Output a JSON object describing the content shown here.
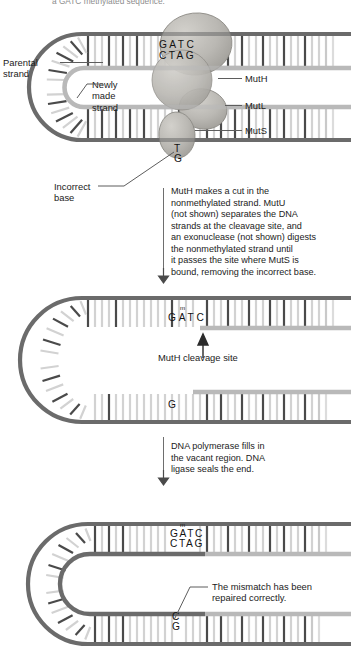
{
  "figure": {
    "title_fragment": "a GATC methylated sequence.",
    "kind": "DNA mismatch repair pathway (MutS / MutL / MutH)"
  },
  "panel1": {
    "labels": {
      "parental_strand": "Parental\nstrand",
      "newly_made_strand": "Newly\nmade\nstrand",
      "incorrect_base": "Incorrect\nbase",
      "muth": "MutH",
      "mutl": "MutL",
      "muts": "MutS"
    },
    "bases": {
      "top_strand": "GATC",
      "bottom_strand": "CTAG",
      "mismatch_top": "T",
      "mismatch_bottom": "G"
    }
  },
  "caption1": {
    "text": "MutH makes a cut in the\nnonmethylated strand. MutU\n(not shown) separates the DNA\nstrands at the cleavage site, and\nan exonuclease (not shown) digests\nthe nonmethylated strand until\nit passes the site where MutS is\nbound, removing the incorrect base."
  },
  "panel2": {
    "labels": {
      "cleavage_site": "MutH cleavage site"
    },
    "bases": {
      "top_strand": "GATC",
      "methyl_mark": "m",
      "lone_base": "G"
    }
  },
  "caption2": {
    "text": "DNA polymerase fills in\nthe vacant region. DNA\nligase seals the end."
  },
  "panel3": {
    "labels": {
      "repaired": "The mismatch has been\nrepaired correctly."
    },
    "bases": {
      "top_strand": "GATC",
      "bottom_strand": "CTAG",
      "methyl_mark": "m",
      "repaired_top": "C",
      "repaired_bottom": "G"
    }
  },
  "colors": {
    "parental_strand": "#6b6b6b",
    "new_strand": "#b9b9b9",
    "base_dark": "#4a4a4a",
    "base_light": "#cfcfcf",
    "protein_fill": "#b4b2ad",
    "protein_edge": "#8e8c87",
    "leader": "#5d5d5d",
    "text": "#1b1b1b"
  }
}
